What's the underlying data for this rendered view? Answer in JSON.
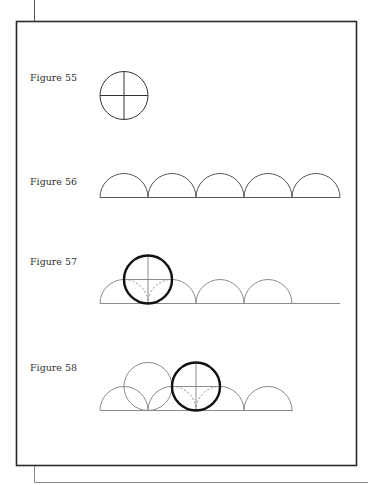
{
  "page": {
    "colors": {
      "frame": "#2a2a2a",
      "back_frame": "#8a8a8a",
      "thin_stroke": "#8c8c8c",
      "dark_stroke": "#222222",
      "thick_circle": "#111111"
    }
  },
  "figures": [
    {
      "label": "Figure 55",
      "description": "Circle divided by vertical and horizontal diameters"
    },
    {
      "label": "Figure 56",
      "description": "Row of five adjoining semicircles on a baseline"
    },
    {
      "label": "Figure 57",
      "description": "Bold circle rolled onto semicircle row with dotted arcs inside"
    },
    {
      "label": "Figure 58",
      "description": "Thin circle and bold circle overlapping semicircle row"
    }
  ]
}
